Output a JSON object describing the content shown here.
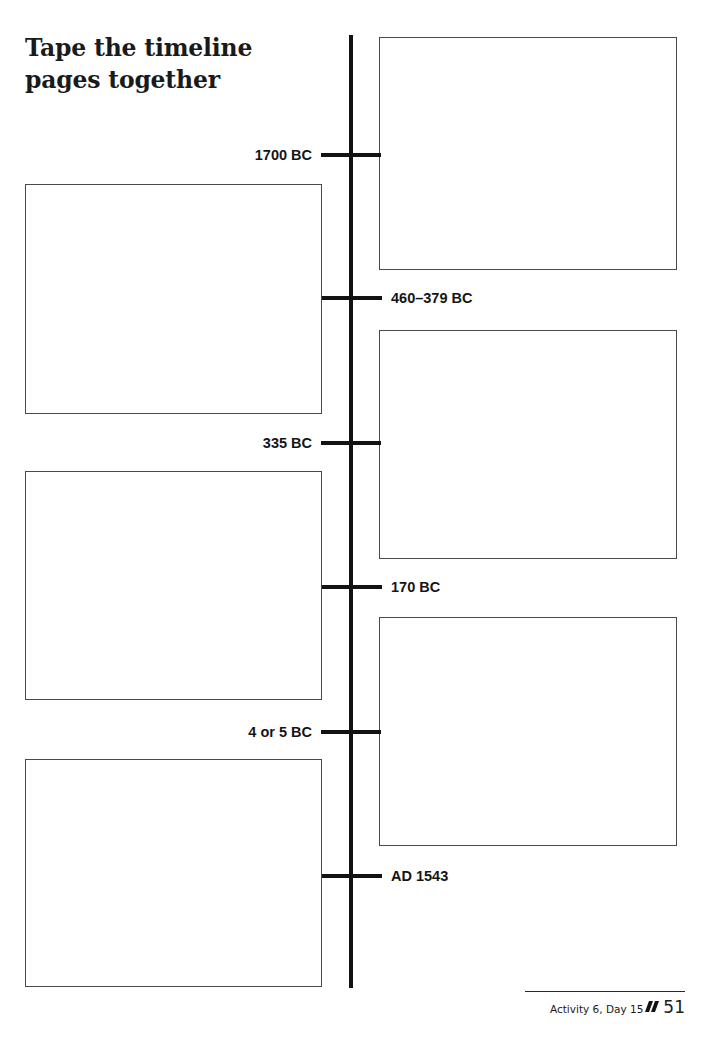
{
  "page": {
    "title": "Tape the timeline\npages together",
    "width": 710,
    "height": 1039,
    "background": "#ffffff",
    "ink": "#121212"
  },
  "timeline": {
    "axis": {
      "x": 351,
      "top": 35,
      "bottom": 988,
      "thickness": 4,
      "color": "#121212"
    },
    "ticks": [
      {
        "label": "1700 BC",
        "side": "left",
        "y": 155
      },
      {
        "label": "460–379 BC",
        "side": "right",
        "y": 298
      },
      {
        "label": "335 BC",
        "side": "left",
        "y": 443
      },
      {
        "label": "170 BC",
        "side": "right",
        "y": 587
      },
      {
        "label": "4 or 5 BC",
        "side": "left",
        "y": 732
      },
      {
        "label": "AD 1543",
        "side": "right",
        "y": 876
      }
    ]
  },
  "frames": [
    {
      "name": "frame-right-1",
      "side": "right",
      "x": 379,
      "y": 37,
      "w": 298,
      "h": 233
    },
    {
      "name": "frame-left-1",
      "side": "left",
      "x": 25,
      "y": 184,
      "w": 297,
      "h": 230
    },
    {
      "name": "frame-right-2",
      "side": "right",
      "x": 379,
      "y": 330,
      "w": 298,
      "h": 229
    },
    {
      "name": "frame-left-2",
      "side": "left",
      "x": 25,
      "y": 471,
      "w": 297,
      "h": 229
    },
    {
      "name": "frame-right-3",
      "side": "right",
      "x": 379,
      "y": 617,
      "w": 298,
      "h": 229
    },
    {
      "name": "frame-left-3",
      "side": "left",
      "x": 25,
      "y": 759,
      "w": 297,
      "h": 228
    }
  ],
  "footer": {
    "activity": "Activity 6, Day 15",
    "page_number": "51",
    "marks": 2
  }
}
